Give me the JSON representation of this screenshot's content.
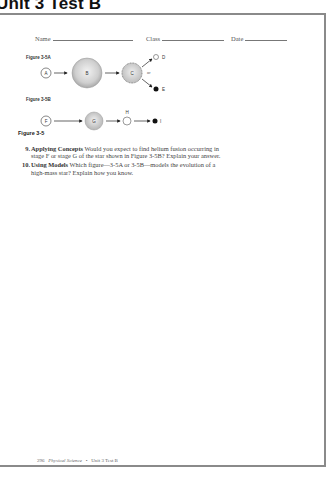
{
  "unit_title": "Unit 3 Test B",
  "header": {
    "name_label": "Name",
    "class_label": "Class",
    "date_label": "Date"
  },
  "figure_a": {
    "label": "Figure 3-5A",
    "stages": [
      "A",
      "B",
      "C",
      "D",
      "E"
    ],
    "or_text": "or"
  },
  "figure_b": {
    "label": "Figure 3-5B",
    "stages": [
      "F",
      "G",
      "H",
      "I"
    ]
  },
  "figure_caption": "Figure 3-5",
  "questions": [
    {
      "number": "9.",
      "title": "Applying Concepts",
      "text": " Would you expect to find helium fusion occurring in stage F or stage G of the star shown in Figure 3-5B? Explain your answer."
    },
    {
      "number": "10.",
      "title": "Using Models",
      "text": " Which figure—3-5A or 3-5B—models the evolution of a high-mass star? Explain how you know."
    }
  ],
  "footer": {
    "page_number": "296",
    "book_title": "Physical Science",
    "bullet": "•",
    "section": "Unit 3 Test B"
  }
}
